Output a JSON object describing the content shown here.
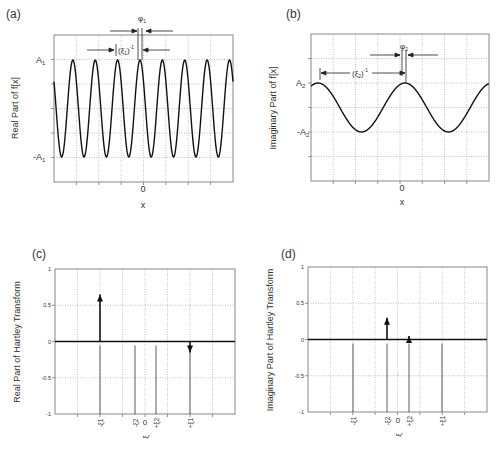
{
  "chart_data": [
    {
      "panel": "(a)",
      "type": "line",
      "title": "",
      "xlabel": "x",
      "ylabel": "Real Part of f[x]",
      "x_tick_labels": [
        "0"
      ],
      "y_tick_labels": [
        "A1",
        "-A1"
      ],
      "description": "Cosine with amplitude A1, period (ξ1)^-1, phase shift φ1",
      "amplitude": "A1",
      "cycles_shown": 8,
      "annotations": [
        "φ1",
        "(ξ1)^-1"
      ],
      "grid": true
    },
    {
      "panel": "(b)",
      "type": "line",
      "title": "",
      "xlabel": "x",
      "ylabel": "Imaginary Part of f[x]",
      "x_tick_labels": [
        "0"
      ],
      "y_tick_labels": [
        "A2",
        "-A2"
      ],
      "description": "Cosine with amplitude A2, period (ξ2)^-1, phase shift φ2",
      "amplitude": "A2",
      "cycles_shown": 2,
      "annotations": [
        "φ2",
        "(ξ2)^-1"
      ],
      "grid": true
    },
    {
      "panel": "(c)",
      "type": "bar",
      "title": "",
      "xlabel": "ξ",
      "ylabel": "Real Part of Hartley Transform",
      "ylim": [
        -1,
        1
      ],
      "y_ticks": [
        1,
        0.5,
        0,
        -0.5,
        -1
      ],
      "categories": [
        "-ξ1",
        "-ξ2",
        "0",
        "+ξ2",
        "+ξ1"
      ],
      "values": [
        0.65,
        0,
        0,
        0,
        -0.15
      ],
      "grid": true
    },
    {
      "panel": "(d)",
      "type": "bar",
      "title": "",
      "xlabel": "ξ",
      "ylabel": "Imaginary Part of Hartley Transform",
      "ylim": [
        -1,
        1
      ],
      "y_ticks": [
        1,
        0.5,
        0,
        -0.5,
        -1
      ],
      "categories": [
        "-ξ1",
        "-ξ2",
        "0",
        "+ξ2",
        "+ξ1"
      ],
      "values": [
        0,
        0.3,
        0,
        0.05,
        0
      ],
      "grid": true
    }
  ],
  "panels": {
    "a": {
      "tag": "(a)",
      "ylabel": "Real Part of f[x]",
      "xlabel": "x",
      "zero": "0",
      "ytop": "A",
      "ytop_sub": "1",
      "ybot": "-A",
      "ybot_sub": "1",
      "phi": "φ",
      "phi_sub": "1",
      "period": "(ξ",
      "period_sub": "1",
      "period_end": ")",
      "period_sup": "-1"
    },
    "b": {
      "tag": "(b)",
      "ylabel": "Imaginary Part of f[x]",
      "xlabel": "x",
      "zero": "0",
      "ytop": "A",
      "ytop_sub": "2",
      "ybot": "-A",
      "ybot_sub": "2",
      "phi": "φ",
      "phi_sub": "2",
      "period": "(ξ",
      "period_sub": "2",
      "period_end": ")",
      "period_sup": "-1"
    },
    "c": {
      "tag": "(c)",
      "ylabel": "Real Part of Hartley Transform",
      "xlabel": "ξ",
      "yt": [
        "1",
        "0.5",
        "0",
        "-0.5",
        "-1"
      ],
      "xt": [
        "-ξ1",
        "-ξ2",
        "0",
        "+ξ2",
        "+ξ1"
      ]
    },
    "d": {
      "tag": "(d)",
      "ylabel": "Imaginary Part of Hartley Transform",
      "xlabel": "ξ",
      "yt": [
        "1",
        "0.5",
        "0",
        "-0.5",
        "-1"
      ],
      "xt": [
        "-ξ1",
        "-ξ2",
        "0",
        "+ξ2",
        "+ξ1"
      ]
    }
  }
}
